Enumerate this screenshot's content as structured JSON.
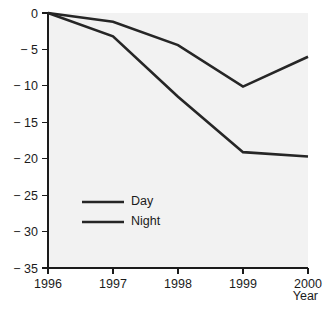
{
  "chart_data": {
    "type": "line",
    "title": "",
    "xlabel": "Year",
    "ylabel": "",
    "categories": [
      "1996",
      "1997",
      "1998",
      "1999",
      "2000"
    ],
    "x": [
      1996,
      1997,
      1998,
      1999,
      2000
    ],
    "xlim": [
      1996,
      2000
    ],
    "ylim": [
      -35,
      0
    ],
    "yticks": [
      0,
      -5,
      -10,
      -15,
      -20,
      -25,
      -30,
      -35
    ],
    "ytick_labels": [
      "0",
      "− 5",
      "− 10",
      "− 15",
      "− 20",
      "− 25",
      "− 30",
      "− 35"
    ],
    "xticks": [
      1996,
      1997,
      1998,
      1999,
      2000
    ],
    "xtick_labels": [
      "1996",
      "1997",
      "1998",
      "1999",
      "2000"
    ],
    "grid": false,
    "legend_position": "center-left-inside",
    "series": [
      {
        "name": "Day",
        "color": "#262626",
        "values": [
          0,
          -1.2,
          -4.4,
          -10.1,
          -6.0
        ]
      },
      {
        "name": "Night",
        "color": "#262626",
        "values": [
          0,
          -3.2,
          -11.5,
          -19.1,
          -19.7
        ]
      }
    ]
  },
  "legend": {
    "items": [
      {
        "label": "Day"
      },
      {
        "label": "Night"
      }
    ]
  },
  "axes": {
    "x_axis_title": "Year"
  },
  "colors": {
    "plot_background": "#f2f2f2",
    "page_background": "#ffffff",
    "axis": "#1b1b1b",
    "series_day": "#262626",
    "series_night": "#262626"
  }
}
